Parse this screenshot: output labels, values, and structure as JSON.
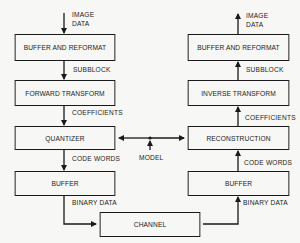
{
  "encoder": {
    "input_label": [
      "IMAGE",
      "DATA"
    ],
    "blocks": [
      {
        "id": "enc-buffer-reformat",
        "label": "BUFFER AND REFORMAT"
      },
      {
        "id": "forward-transform",
        "label": "FORWARD TRANSFORM"
      },
      {
        "id": "quantizer",
        "label": "QUANTIZER"
      },
      {
        "id": "enc-buffer",
        "label": "BUFFER"
      }
    ],
    "edge_labels": [
      "SUBBLOCK",
      "COEFFICIENTS",
      "CODE WORDS",
      "BINARY DATA"
    ]
  },
  "decoder": {
    "output_label": [
      "IMAGE",
      "DATA"
    ],
    "blocks": [
      {
        "id": "dec-buffer-reformat",
        "label": "BUFFER AND REFORMAT"
      },
      {
        "id": "inverse-transform",
        "label": "INVERSE TRANSFORM"
      },
      {
        "id": "reconstruction",
        "label": "RECONSTRUCTION"
      },
      {
        "id": "dec-buffer",
        "label": "BUFFER"
      }
    ],
    "edge_labels": [
      "SUBBLOCK",
      "COEFFICIENTS",
      "CODE WORDS",
      "BINARY DATA"
    ]
  },
  "channel": {
    "label": "CHANNEL"
  },
  "model": {
    "label": "MODEL"
  },
  "colors": {
    "line": "#1a1a1a",
    "background": "#f7f7f5"
  }
}
